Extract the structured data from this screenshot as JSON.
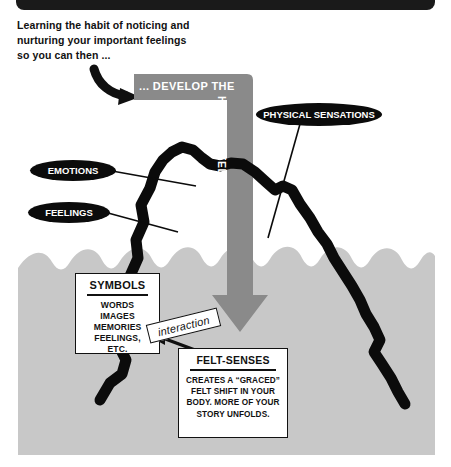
{
  "page": {
    "width": 451,
    "height": 467,
    "background_color": "#ffffff",
    "topbar_color": "#1a1a1a",
    "water_color": "#c8c8c8",
    "band_color": "#8a8a8a",
    "ink_color": "#0b0b0b"
  },
  "intro": {
    "line1": "Learning the habit of noticing and",
    "line2": "nurturing your important feelings",
    "line3": "so you can then ..."
  },
  "band": {
    "horizontal_label": "... DEVELOP THE",
    "vertical_label": "HABIT OF  FELT-SENSING"
  },
  "ovals": {
    "emotions": "EMOTIONS",
    "feelings": "FEELINGS",
    "physical": "PHYSICAL SENSATIONS"
  },
  "symbols_box": {
    "title": "SYMBOLS",
    "lines": [
      "WORDS",
      "IMAGES",
      "MEMORIES",
      "FEELINGS,",
      "ETC."
    ]
  },
  "felt_senses_box": {
    "title": "FELT-SENSES",
    "lines": [
      "CREATES A “GRACED”",
      "FELT SHIFT IN YOUR",
      "BODY. MORE OF YOUR",
      "STORY UNFOLDS."
    ]
  },
  "interaction": {
    "label": "interaction"
  }
}
